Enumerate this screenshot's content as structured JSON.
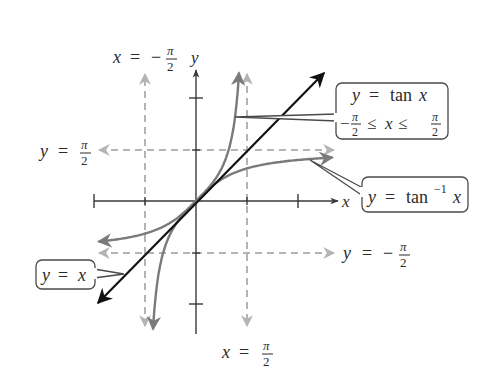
{
  "figure": {
    "axes": {
      "x_label": "x",
      "y_label": "y",
      "origin_px": [
        196,
        201
      ],
      "unit_px": 32.5,
      "x_ticks": [
        -3.14159,
        -1.5708,
        1.5708,
        3.14159
      ],
      "y_ticks": [
        3.14159,
        1.5708,
        -1.5708,
        -3.14159
      ]
    },
    "asymptotes": {
      "vertical_left": {
        "label_lhs": "x",
        "label_eq": "=",
        "label_sign": "−",
        "label_num": "π",
        "label_den": "2"
      },
      "vertical_right": {
        "label_lhs": "x",
        "label_eq": "=",
        "label_sign": "",
        "label_num": "π",
        "label_den": "2"
      },
      "horizontal_top": {
        "label_lhs": "y",
        "label_eq": "=",
        "label_sign": "",
        "label_num": "π",
        "label_den": "2"
      },
      "horizontal_bottom": {
        "label_lhs": "y",
        "label_eq": "=",
        "label_sign": "−",
        "label_num": "π",
        "label_den": "2"
      }
    },
    "callouts": {
      "tan": {
        "line1_lhs": "y",
        "line1_eq": "=",
        "line1_fn": "tan",
        "line1_var": "x",
        "line2_sign": "−",
        "line2_num": "π",
        "line2_den": "2",
        "line2_leq1": "≤",
        "line2_var": "x",
        "line2_leq2": "≤",
        "line2_num_r": "π",
        "line2_den_r": "2"
      },
      "arctan": {
        "lhs": "y",
        "eq": "=",
        "fn": "tan",
        "sup": "−1",
        "var": "x"
      },
      "identity": {
        "lhs": "y",
        "eq": "=",
        "var": "x"
      }
    },
    "colors": {
      "axes": "#3a3a3a",
      "identity_line": "#111111",
      "curves": "#7a7a7a",
      "asymptotes": "#b4b4b4",
      "callout_border": "#4a4a4a"
    }
  }
}
